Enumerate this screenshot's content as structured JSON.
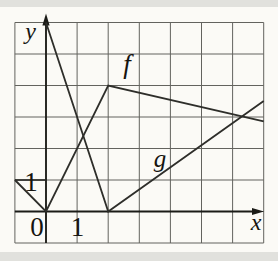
{
  "figure": {
    "axis_labels": {
      "x": "x",
      "y": "y"
    },
    "origin_label": "0",
    "x_tick_label": "1",
    "y_tick_label": "1",
    "curve_labels": {
      "f": "f",
      "g": "g"
    }
  },
  "colors": {
    "background": "#fbfaf6",
    "grid": "#63635e",
    "axis": "#1b1b17",
    "curve": "#2e2e2a",
    "scan_band": "#d8d8d4"
  },
  "chart_data": {
    "type": "line",
    "title": "",
    "xlabel": "x",
    "ylabel": "y",
    "x_range_shown": [
      -1,
      7
    ],
    "y_range_shown": [
      -1,
      6
    ],
    "grid": true,
    "x_axis_row": 0,
    "y_axis_col": 0,
    "tick_labels": {
      "x": [
        "0",
        "1"
      ],
      "y": [
        "1"
      ]
    },
    "series": [
      {
        "name": "f",
        "points": [
          [
            -1,
            1
          ],
          [
            0,
            0
          ],
          [
            2,
            4
          ],
          [
            7,
            2.86
          ]
        ]
      },
      {
        "name": "g",
        "points": [
          [
            0,
            6
          ],
          [
            2,
            0
          ],
          [
            7,
            3.51
          ]
        ]
      }
    ],
    "legend": "labels drawn beside curves"
  }
}
